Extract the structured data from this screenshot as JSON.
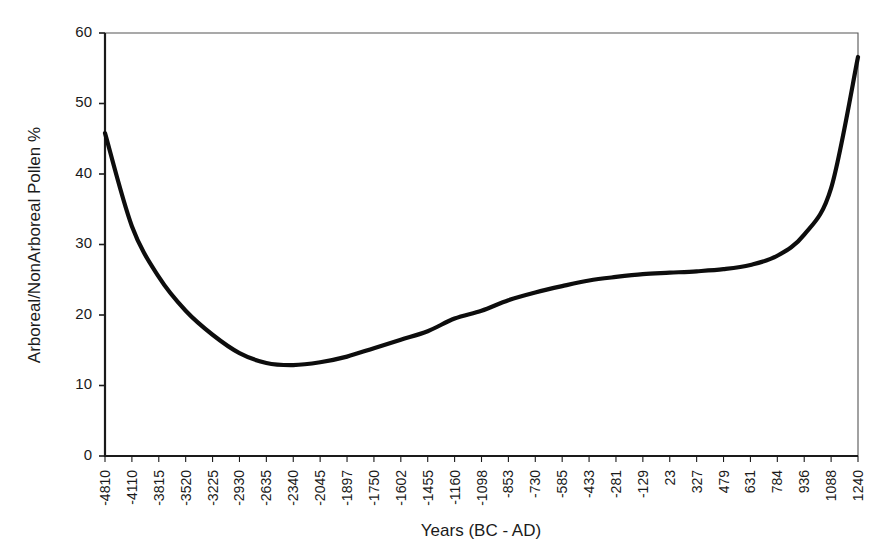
{
  "chart_data": {
    "type": "line",
    "title": "",
    "xlabel": "Years (BC - AD)",
    "ylabel": "Arboreal/NonArboreal Pollen %",
    "grid": false,
    "legend": "none",
    "ylim": [
      0,
      60
    ],
    "yticks": [
      0,
      10,
      20,
      30,
      40,
      50,
      60
    ],
    "ytick_labels": [
      "0",
      "10",
      "20",
      "30",
      "40",
      "50",
      "60"
    ],
    "categories": [
      "-4810",
      "-4110",
      "-3815",
      "-3520",
      "-3225",
      "-2930",
      "-2635",
      "-2340",
      "-2045",
      "-1897",
      "-1750",
      "-1602",
      "-1455",
      "-1160",
      "-1098",
      "-853",
      "-730",
      "-585",
      "-433",
      "-281",
      "-129",
      "23",
      "327",
      "479",
      "631",
      "784",
      "936",
      "1088",
      "1240"
    ],
    "series": [
      {
        "name": "Arboreal/NonArboreal Pollen %",
        "color": "#0d0d0d",
        "values": [
          45.8,
          32.6,
          25.4,
          20.6,
          17.2,
          14.6,
          13.2,
          12.9,
          13.3,
          14.1,
          15.3,
          16.5,
          17.7,
          19.5,
          20.6,
          22.1,
          23.2,
          24.1,
          24.9,
          25.4,
          25.8,
          26.0,
          26.2,
          26.5,
          27.1,
          28.4,
          31.4,
          38.0,
          56.6
        ]
      }
    ]
  },
  "axes": {
    "y_title": "Arboreal/NonArboreal Pollen %",
    "x_title": "Years (BC - AD)"
  }
}
